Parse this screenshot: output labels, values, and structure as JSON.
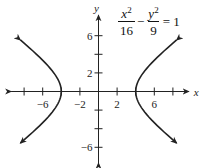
{
  "chart_data": {
    "type": "line",
    "title": "",
    "equation": {
      "term1": {
        "numerator_var": "x",
        "numerator_exp": "2",
        "denominator": "16"
      },
      "operator": "−",
      "term2": {
        "numerator_var": "y",
        "numerator_exp": "2",
        "denominator": "9"
      },
      "rhs": "= 1"
    },
    "xlabel": "x",
    "ylabel": "y",
    "xlim": [
      -9.4,
      9.7
    ],
    "ylim": [
      -7.7,
      8.2
    ],
    "x_ticks": [
      -8,
      -6,
      -4,
      -2,
      2,
      4,
      6,
      8
    ],
    "x_tick_labels": [
      {
        "value": -6,
        "label": "−6"
      },
      {
        "value": -2,
        "label": "−2"
      },
      {
        "value": 2,
        "label": "2"
      },
      {
        "value": 6,
        "label": "6"
      }
    ],
    "y_ticks": [
      -6,
      -4,
      -2,
      2,
      4,
      6
    ],
    "y_tick_labels": [
      {
        "value": 6,
        "label": "6"
      },
      {
        "value": 2,
        "label": "2"
      },
      {
        "value": -6,
        "label": "−6"
      }
    ],
    "grid": false,
    "series": [
      {
        "name": "right branch",
        "a": 4,
        "b": 3,
        "x_range": [
          4,
          8.4
        ],
        "arrows": true
      },
      {
        "name": "left branch",
        "a": 4,
        "b": 3,
        "x_range": [
          -8.4,
          -4
        ],
        "arrows": true
      }
    ],
    "colors": {
      "axis": "#222222",
      "curve": "#222222"
    }
  }
}
